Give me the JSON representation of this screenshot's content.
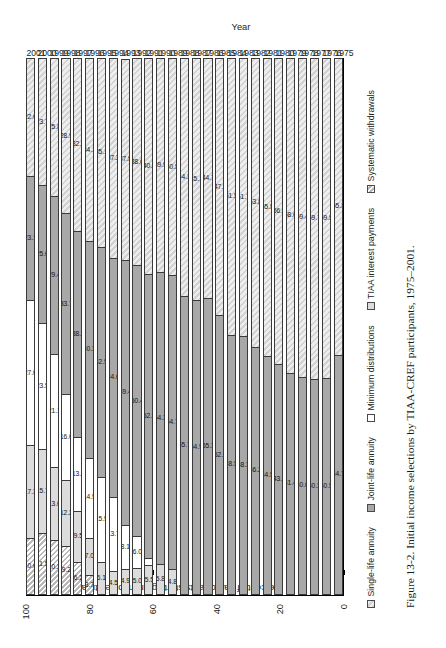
{
  "figure": {
    "caption": "Figure 13-2. Initial income selections by TIAA-CREF participants, 1975–2001.",
    "y_axis_title": "Percent of participants starting an income stream",
    "x_axis_title": "Year"
  },
  "legend": {
    "items": [
      {
        "label": "Single-life annuity",
        "key": "single",
        "swatch": "hatch-diagonal-light"
      },
      {
        "label": "Joint-life annuity",
        "key": "joint",
        "swatch": "solid-gray"
      },
      {
        "label": "Minimum distributions",
        "key": "minimum",
        "swatch": "solid-white"
      },
      {
        "label": "TIAA interest payments",
        "key": "tiaa",
        "swatch": "solid-lightgray"
      },
      {
        "label": "Systematic withdrawals",
        "key": "systematic",
        "swatch": "hatch-diagonal"
      }
    ]
  },
  "chart_data": {
    "type": "bar",
    "title": "Initial income selections by TIAA-CREF participants, 1975–2001",
    "xlabel": "Year",
    "ylabel": "Percent of participants starting an income stream",
    "ylim": [
      0,
      100
    ],
    "yticks": [
      100,
      80,
      60,
      40,
      20,
      0
    ],
    "grid": false,
    "orientation": "horizontal-stacked",
    "legend_position": "bottom",
    "stacked": true,
    "stack_total": 100,
    "categories": [
      "1975",
      "1976",
      "1977",
      "1978",
      "1979",
      "1980",
      "1981",
      "1982",
      "1983",
      "1984",
      "1985",
      "1986",
      "1987",
      "1988",
      "1989",
      "1990",
      "1991",
      "1992",
      "1993",
      "1994",
      "1995",
      "1996",
      "1997",
      "1998",
      "1999",
      "2000",
      "2001"
    ],
    "series": [
      {
        "name": "Systematic withdrawals",
        "values": [
          null,
          null,
          null,
          null,
          null,
          null,
          null,
          null,
          null,
          null,
          null,
          null,
          null,
          null,
          null,
          null,
          null,
          null,
          null,
          null,
          null,
          3.7,
          6.2,
          9.2,
          10.2,
          11.5,
          10.6
        ]
      },
      {
        "name": "TIAA interest payments",
        "values": [
          null,
          null,
          null,
          null,
          null,
          null,
          null,
          null,
          null,
          null,
          null,
          null,
          null,
          null,
          4.8,
          5.8,
          5.5,
          5.0,
          4.9,
          4.5,
          6.1,
          7.0,
          9.5,
          12.2,
          13.6,
          15.7,
          17.3
        ]
      },
      {
        "name": "Minimum distributions",
        "values": [
          null,
          null,
          null,
          null,
          null,
          null,
          null,
          null,
          null,
          null,
          null,
          null,
          null,
          null,
          null,
          null,
          null,
          6.0,
          8.1,
          13.7,
          15.9,
          14.9,
          13.7,
          16.0,
          21.1,
          23.5,
          27.0
        ]
      },
      {
        "name": "Joint-life annuity",
        "values": [
          44.7,
          40.5,
          40.3,
          40.6,
          41.4,
          43.1,
          44.5,
          46.2,
          48.3,
          48.5,
          52.1,
          55.3,
          54.9,
          55.7,
          54.7,
          54.3,
          52.9,
          50.4,
          49.4,
          44.6,
          42.9,
          40.3,
          38.5,
          33.7,
          29.4,
          25.6,
          23.1
        ]
      },
      {
        "name": "Single-life annuity",
        "values": [
          55.3,
          59.5,
          59.7,
          59.4,
          58.6,
          56.9,
          55.5,
          53.8,
          51.7,
          51.5,
          47.9,
          44.7,
          45.1,
          44.3,
          40.5,
          39.9,
          40.3,
          38.6,
          37.5,
          37.2,
          35.1,
          34.1,
          32.2,
          28.9,
          25.8,
          23.7,
          22.0
        ]
      }
    ],
    "bars": [
      {
        "year": "2001",
        "segments": [
          {
            "cat": "systematic",
            "value": 10.6,
            "label": "10.6"
          },
          {
            "cat": "tiaa",
            "value": 17.3,
            "label": "17.3"
          },
          {
            "cat": "minimum",
            "value": 27.0,
            "label": "27.0"
          },
          {
            "cat": "joint",
            "value": 23.1,
            "label": "23.1"
          },
          {
            "cat": "single",
            "value": 22.0,
            "label": "22.0"
          }
        ]
      },
      {
        "year": "2000",
        "segments": [
          {
            "cat": "systematic",
            "value": 11.5,
            "label": "11.5"
          },
          {
            "cat": "tiaa",
            "value": 15.7,
            "label": "15.7"
          },
          {
            "cat": "minimum",
            "value": 23.5,
            "label": "23.5"
          },
          {
            "cat": "joint",
            "value": 25.6,
            "label": "25.6"
          },
          {
            "cat": "single",
            "value": 23.7,
            "label": "23.7"
          }
        ]
      },
      {
        "year": "1999",
        "segments": [
          {
            "cat": "systematic",
            "value": 10.2,
            "label": "10.2"
          },
          {
            "cat": "tiaa",
            "value": 13.6,
            "label": "13.6"
          },
          {
            "cat": "minimum",
            "value": 21.1,
            "label": "21.1"
          },
          {
            "cat": "joint",
            "value": 29.4,
            "label": "29.4"
          },
          {
            "cat": "single",
            "value": 25.8,
            "label": "25.8"
          }
        ]
      },
      {
        "year": "1998",
        "segments": [
          {
            "cat": "systematic",
            "value": 9.2,
            "label": "9.2"
          },
          {
            "cat": "tiaa",
            "value": 12.2,
            "label": "12.2"
          },
          {
            "cat": "minimum",
            "value": 16.0,
            "label": "16.0"
          },
          {
            "cat": "joint",
            "value": 33.7,
            "label": "33.7"
          },
          {
            "cat": "single",
            "value": 28.9,
            "label": "28.9"
          }
        ]
      },
      {
        "year": "1997",
        "segments": [
          {
            "cat": "systematic",
            "value": 6.2,
            "label": "6.2"
          },
          {
            "cat": "tiaa",
            "value": 9.5,
            "label": "9.5"
          },
          {
            "cat": "minimum",
            "value": 13.7,
            "label": "13.7"
          },
          {
            "cat": "joint",
            "value": 38.5,
            "label": "38.5"
          },
          {
            "cat": "single",
            "value": 32.2,
            "label": "32.2"
          }
        ]
      },
      {
        "year": "1996",
        "segments": [
          {
            "cat": "systematic",
            "value": 3.7,
            "label": "3.7"
          },
          {
            "cat": "tiaa",
            "value": 7.0,
            "label": "7.0"
          },
          {
            "cat": "minimum",
            "value": 14.9,
            "label": "14.9"
          },
          {
            "cat": "joint",
            "value": 40.3,
            "label": "40.3"
          },
          {
            "cat": "single",
            "value": 34.1,
            "label": "34.1"
          }
        ]
      },
      {
        "year": "1995",
        "segments": [
          {
            "cat": "tiaa",
            "value": 6.1,
            "label": "6.1"
          },
          {
            "cat": "minimum",
            "value": 15.9,
            "label": "15.9"
          },
          {
            "cat": "joint",
            "value": 42.9,
            "label": "42.9"
          },
          {
            "cat": "single",
            "value": 35.1,
            "label": "35.1"
          }
        ]
      },
      {
        "year": "1994",
        "segments": [
          {
            "cat": "tiaa",
            "value": 4.5,
            "label": "4.5"
          },
          {
            "cat": "minimum",
            "value": 13.7,
            "label": "13.7"
          },
          {
            "cat": "joint",
            "value": 44.6,
            "label": "44.6"
          },
          {
            "cat": "single",
            "value": 37.2,
            "label": "37.2"
          }
        ]
      },
      {
        "year": "1993",
        "segments": [
          {
            "cat": "tiaa",
            "value": 4.9,
            "label": "4.9"
          },
          {
            "cat": "minimum",
            "value": 8.1,
            "label": "8.1"
          },
          {
            "cat": "joint",
            "value": 49.4,
            "label": "49.4"
          },
          {
            "cat": "single",
            "value": 37.5,
            "label": "37.5"
          }
        ]
      },
      {
        "year": "1992",
        "segments": [
          {
            "cat": "tiaa",
            "value": 5.0,
            "label": "5.0"
          },
          {
            "cat": "minimum",
            "value": 6.0,
            "label": "6.0"
          },
          {
            "cat": "joint",
            "value": 50.4,
            "label": "50.4"
          },
          {
            "cat": "single",
            "value": 38.6,
            "label": "38.6"
          }
        ]
      },
      {
        "year": "1991",
        "segments": [
          {
            "cat": "tiaa",
            "value": 5.5,
            "label": "5.5"
          },
          {
            "cat": "minimum",
            "value": 1.3,
            "label": ""
          },
          {
            "cat": "joint",
            "value": 52.9,
            "label": "52.9"
          },
          {
            "cat": "single",
            "value": 40.3,
            "label": "40.3"
          }
        ]
      },
      {
        "year": "1990",
        "segments": [
          {
            "cat": "tiaa",
            "value": 5.8,
            "label": "5.8"
          },
          {
            "cat": "joint",
            "value": 54.3,
            "label": "54.3"
          },
          {
            "cat": "single",
            "value": 39.9,
            "label": "39.9"
          }
        ]
      },
      {
        "year": "1989",
        "segments": [
          {
            "cat": "tiaa",
            "value": 4.8,
            "label": "4.8"
          },
          {
            "cat": "joint",
            "value": 54.7,
            "label": "54.7"
          },
          {
            "cat": "single",
            "value": 40.5,
            "label": "40.5"
          }
        ]
      },
      {
        "year": "1988",
        "segments": [
          {
            "cat": "joint",
            "value": 55.7,
            "label": "55.7"
          },
          {
            "cat": "single",
            "value": 44.3,
            "label": "44.3"
          }
        ]
      },
      {
        "year": "1987",
        "segments": [
          {
            "cat": "joint",
            "value": 54.9,
            "label": "54.9"
          },
          {
            "cat": "single",
            "value": 45.1,
            "label": "45.1"
          }
        ]
      },
      {
        "year": "1986",
        "segments": [
          {
            "cat": "joint",
            "value": 55.3,
            "label": "55.3"
          },
          {
            "cat": "single",
            "value": 44.7,
            "label": "44.7"
          }
        ]
      },
      {
        "year": "1985",
        "segments": [
          {
            "cat": "joint",
            "value": 52.1,
            "label": "52.1"
          },
          {
            "cat": "single",
            "value": 47.9,
            "label": "47.9"
          }
        ]
      },
      {
        "year": "1984",
        "segments": [
          {
            "cat": "joint",
            "value": 48.5,
            "label": "48.5"
          },
          {
            "cat": "single",
            "value": 51.5,
            "label": "51.5"
          }
        ]
      },
      {
        "year": "1983",
        "segments": [
          {
            "cat": "joint",
            "value": 48.3,
            "label": "48.3"
          },
          {
            "cat": "single",
            "value": 51.7,
            "label": "51.7"
          }
        ]
      },
      {
        "year": "1982",
        "segments": [
          {
            "cat": "joint",
            "value": 46.2,
            "label": "46.2"
          },
          {
            "cat": "single",
            "value": 53.8,
            "label": "53.8"
          }
        ]
      },
      {
        "year": "1981",
        "segments": [
          {
            "cat": "joint",
            "value": 44.5,
            "label": "44.5"
          },
          {
            "cat": "single",
            "value": 55.5,
            "label": "55.5"
          }
        ]
      },
      {
        "year": "1980",
        "segments": [
          {
            "cat": "joint",
            "value": 43.1,
            "label": "43.1"
          },
          {
            "cat": "single",
            "value": 56.9,
            "label": "56.9"
          }
        ]
      },
      {
        "year": "1979",
        "segments": [
          {
            "cat": "joint",
            "value": 41.4,
            "label": "41.4"
          },
          {
            "cat": "single",
            "value": 58.6,
            "label": "58.6"
          }
        ]
      },
      {
        "year": "1978",
        "segments": [
          {
            "cat": "joint",
            "value": 40.6,
            "label": "40.6"
          },
          {
            "cat": "single",
            "value": 59.4,
            "label": "59.4"
          }
        ]
      },
      {
        "year": "1977",
        "segments": [
          {
            "cat": "joint",
            "value": 40.3,
            "label": "40.3"
          },
          {
            "cat": "single",
            "value": 59.7,
            "label": "59.7"
          }
        ]
      },
      {
        "year": "1976",
        "segments": [
          {
            "cat": "joint",
            "value": 40.5,
            "label": "40.5"
          },
          {
            "cat": "single",
            "value": 59.5,
            "label": "59.5"
          }
        ]
      },
      {
        "year": "1975",
        "segments": [
          {
            "cat": "joint",
            "value": 44.7,
            "label": "44.7"
          },
          {
            "cat": "single",
            "value": 55.3,
            "label": "55.3"
          }
        ]
      }
    ]
  }
}
